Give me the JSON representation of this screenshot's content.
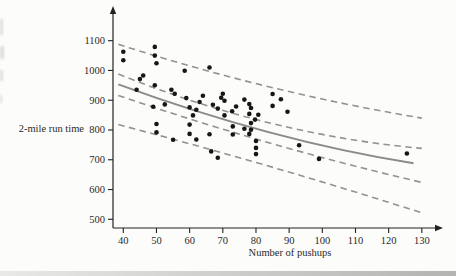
{
  "colors": {
    "dot": "#161614",
    "regression_line": "#8a8a88",
    "band_line": "#929290",
    "axis": "#222220",
    "text": "#2a2a28"
  },
  "chart_data": {
    "type": "scatter",
    "title": "",
    "xlabel": "Number of pushups",
    "ylabel": "2-mile run time",
    "xlim": [
      40,
      130
    ],
    "ylim": [
      500,
      1100
    ],
    "x_ticks": [
      40,
      50,
      60,
      70,
      80,
      90,
      100,
      110,
      120,
      130
    ],
    "y_ticks": [
      500,
      600,
      700,
      800,
      900,
      1000,
      1100
    ],
    "grid": false,
    "legend": "none",
    "points": [
      [
        40,
        1063
      ],
      [
        40,
        1034
      ],
      [
        49.5,
        1079
      ],
      [
        49.5,
        1050
      ],
      [
        50,
        1024
      ],
      [
        46,
        983
      ],
      [
        45,
        971
      ],
      [
        44,
        935
      ],
      [
        49.5,
        950
      ],
      [
        54.5,
        935
      ],
      [
        55.5,
        922
      ],
      [
        58.5,
        999
      ],
      [
        66,
        1010
      ],
      [
        49,
        878
      ],
      [
        52.5,
        886
      ],
      [
        59,
        907
      ],
      [
        64,
        915
      ],
      [
        63,
        894
      ],
      [
        60,
        876
      ],
      [
        62,
        868
      ],
      [
        61,
        849
      ],
      [
        60,
        818
      ],
      [
        60,
        787
      ],
      [
        50,
        820
      ],
      [
        50,
        792
      ],
      [
        55,
        767
      ],
      [
        62,
        768
      ],
      [
        66.5,
        728
      ],
      [
        68.5,
        707
      ],
      [
        70,
        922
      ],
      [
        69.5,
        908
      ],
      [
        70.5,
        898
      ],
      [
        67,
        885
      ],
      [
        68.5,
        872
      ],
      [
        70.5,
        849
      ],
      [
        66,
        786
      ],
      [
        72.8,
        863
      ],
      [
        74,
        879
      ],
      [
        76.5,
        902
      ],
      [
        73,
        812
      ],
      [
        73,
        785
      ],
      [
        76.5,
        804
      ],
      [
        78,
        887
      ],
      [
        78.5,
        874
      ],
      [
        78,
        854
      ],
      [
        80.7,
        851
      ],
      [
        79.7,
        835
      ],
      [
        78.5,
        823
      ],
      [
        78.5,
        801
      ],
      [
        78,
        787
      ],
      [
        80,
        763
      ],
      [
        80,
        740
      ],
      [
        80,
        719
      ],
      [
        85,
        921
      ],
      [
        87.5,
        903
      ],
      [
        85,
        881
      ],
      [
        89.5,
        861
      ],
      [
        93,
        749
      ],
      [
        99,
        703
      ],
      [
        125.5,
        721
      ]
    ],
    "regression_line": {
      "style": "solid",
      "points": [
        [
          38.5,
          953
        ],
        [
          84,
          792
        ],
        [
          127.5,
          688
        ]
      ]
    },
    "bands": [
      {
        "name": "prediction-band-upper",
        "style": "dashed",
        "points": [
          [
            38.5,
            1088
          ],
          [
            84,
            945
          ],
          [
            130,
            840
          ]
        ]
      },
      {
        "name": "confidence-band-upper",
        "style": "dashed",
        "points": [
          [
            38.5,
            988
          ],
          [
            84,
            824
          ],
          [
            130,
            738
          ]
        ]
      },
      {
        "name": "confidence-band-lower",
        "style": "dashed",
        "points": [
          [
            38.5,
            916
          ],
          [
            84,
            757
          ],
          [
            130,
            624
          ]
        ]
      },
      {
        "name": "prediction-band-lower",
        "style": "dashed",
        "points": [
          [
            38.5,
            818
          ],
          [
            84,
            678
          ],
          [
            130,
            522
          ]
        ]
      }
    ]
  }
}
